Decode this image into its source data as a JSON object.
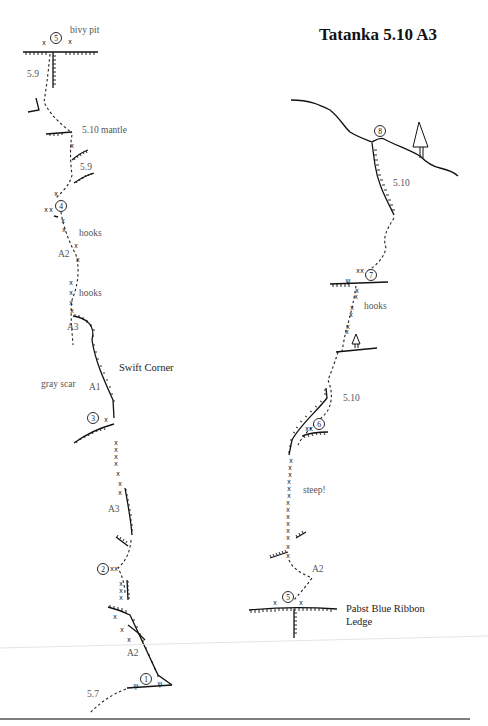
{
  "title": "Tatanka  5.10  A3",
  "left_route": {
    "belays": [
      {
        "number": "5",
        "label": "bivy pit"
      },
      {
        "number": "4"
      },
      {
        "number": "3"
      },
      {
        "number": "2"
      },
      {
        "number": "1"
      }
    ],
    "labels": {
      "grade_59_top": "5.9",
      "mantle": "5.10 mantle",
      "grade_59_mid": "5.9",
      "hooks_1": "hooks",
      "a2_upper": "A2",
      "hooks_2": "hooks",
      "a3_upper": "A3",
      "swift_corner": "Swift Corner",
      "gray_scar": "gray scar",
      "a1": "A1",
      "a3_lower": "A3",
      "a2_lower": "A2",
      "grade_57": "5.7"
    }
  },
  "right_route": {
    "belays": [
      {
        "number": "8"
      },
      {
        "number": "7"
      },
      {
        "number": "6"
      },
      {
        "number": "5",
        "label": "Pabst Blue Ribbon Ledge"
      }
    ],
    "labels": {
      "grade_510_top": "5.10",
      "hooks": "hooks",
      "grade_510_mid": "5.10",
      "steep": "steep!",
      "a2": "A2",
      "ledge_line1": "Pabst Blue Ribbon",
      "ledge_line2": "Ledge"
    }
  },
  "colors": {
    "ink": "#111111",
    "label_gray": "#555555",
    "background": "#ffffff",
    "footer_rule": "#555555"
  }
}
